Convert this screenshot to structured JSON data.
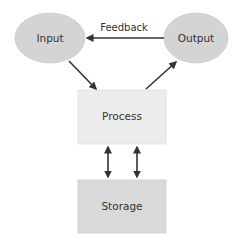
{
  "diagram": {
    "nodes": [
      {
        "id": "input",
        "label": "Input",
        "shape": "ellipse",
        "fill": "#d4d4d4"
      },
      {
        "id": "output",
        "label": "Output",
        "shape": "ellipse",
        "fill": "#d4d4d4"
      },
      {
        "id": "process",
        "label": "Process",
        "shape": "rectangle",
        "fill": "#ececec"
      },
      {
        "id": "storage",
        "label": "Storage",
        "shape": "rectangle",
        "fill": "#d9d9d9"
      }
    ],
    "edges": [
      {
        "from": "output",
        "to": "input",
        "label": "Feedback",
        "direction": "single"
      },
      {
        "from": "input",
        "to": "process",
        "label": "",
        "direction": "single"
      },
      {
        "from": "process",
        "to": "output",
        "label": "",
        "direction": "single"
      },
      {
        "from": "process",
        "to": "storage",
        "label": "",
        "direction": "bidirectional"
      },
      {
        "from": "process",
        "to": "storage",
        "label": "",
        "direction": "bidirectional"
      }
    ],
    "colors": {
      "arrow": "#333333",
      "text": "#333333",
      "ellipse_stroke": "#cfcfcf",
      "box_stroke": "#dddddd"
    }
  }
}
